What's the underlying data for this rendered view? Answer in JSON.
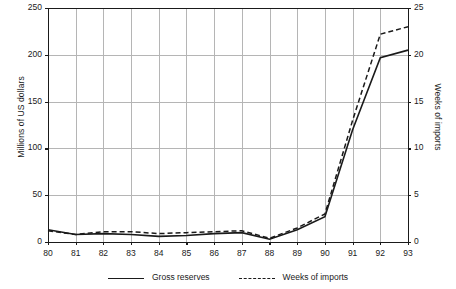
{
  "chart_data": {
    "type": "line",
    "title": "",
    "subtitle": "",
    "xlabel": "",
    "ylabel": "Millions of US dollars",
    "y2label": "Weeks of imports",
    "x": [
      "80",
      "81",
      "82",
      "83",
      "84",
      "85",
      "86",
      "87",
      "88",
      "89",
      "90",
      "91",
      "92",
      "93"
    ],
    "categories": [
      "80",
      "81",
      "82",
      "83",
      "84",
      "85",
      "86",
      "87",
      "88",
      "89",
      "90",
      "91",
      "92",
      "93"
    ],
    "ylim": [
      0,
      250
    ],
    "y2lim": [
      0,
      25
    ],
    "yticks": [
      "0",
      "50",
      "100",
      "150",
      "200",
      "250"
    ],
    "ytick_values": [
      0,
      50,
      100,
      150,
      200,
      250
    ],
    "y2ticks": [
      "0",
      "5",
      "10",
      "15",
      "20",
      "25"
    ],
    "y2tick_values": [
      0,
      5,
      10,
      15,
      20,
      25
    ],
    "grid": true,
    "grid_color": "#b5b5b5",
    "axis_color": "#1a1a1a",
    "legend_position": "bottom",
    "series": [
      {
        "name": "Gross reserves",
        "axis": "left",
        "style": "solid",
        "color": "#1a1a1a",
        "values": [
          13,
          8,
          9,
          8,
          6,
          7,
          9,
          10,
          3,
          13,
          27,
          120,
          197,
          205
        ]
      },
      {
        "name": "Weeks of imports",
        "axis": "right",
        "style": "dashed",
        "color": "#1a1a1a",
        "values": [
          1.2,
          0.8,
          1.1,
          1.1,
          0.9,
          1.0,
          1.1,
          1.2,
          0.4,
          1.5,
          3.0,
          13.0,
          22.2,
          23.0
        ]
      }
    ]
  },
  "legend": {
    "items": [
      {
        "label": "Gross reserves",
        "style": "solid"
      },
      {
        "label": "Weeks of imports",
        "style": "dashed"
      }
    ]
  }
}
